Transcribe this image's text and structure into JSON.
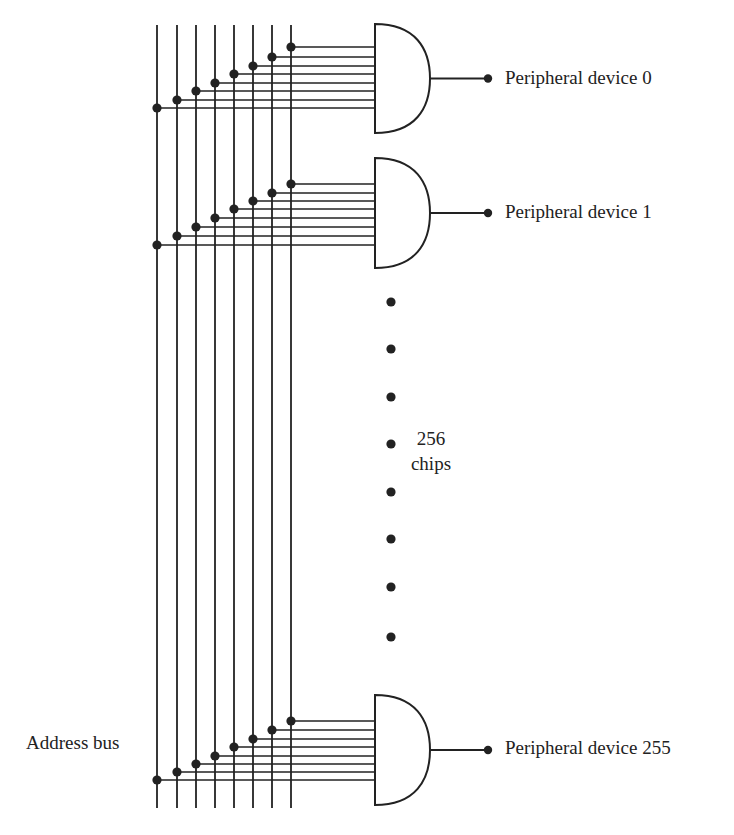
{
  "diagram": {
    "stroke_color": "#222222",
    "background": "#ffffff",
    "bus": {
      "label": "Address bus",
      "line_count": 8,
      "line_x": [
        157,
        177,
        196,
        215,
        234,
        253,
        272,
        291
      ],
      "y_top": 25,
      "y_bottom": 808
    },
    "gates": [
      {
        "id": "gate-0",
        "type": "AND",
        "top": 24,
        "bottom": 133,
        "input_y": [
          108,
          100,
          91,
          83,
          74,
          66,
          57,
          47
        ],
        "output_label": "Peripheral device 0"
      },
      {
        "id": "gate-1",
        "type": "AND",
        "top": 158,
        "bottom": 268,
        "input_y": [
          245,
          236,
          227,
          218,
          209,
          201,
          193,
          184
        ],
        "output_label": "Peripheral device 1"
      },
      {
        "id": "gate-255",
        "type": "AND",
        "top": 695,
        "bottom": 805,
        "input_y": [
          780,
          772,
          764,
          756,
          747,
          739,
          730,
          721
        ],
        "output_label": "Peripheral device 255"
      }
    ],
    "gate_geometry": {
      "left_x": 375,
      "tip_x": 430,
      "output_end_x": 488
    },
    "ellipsis": {
      "x": 391,
      "dot_y": [
        302,
        349,
        397,
        444,
        492,
        539,
        587,
        637
      ],
      "label_line1": "256",
      "label_line2": "chips"
    }
  }
}
